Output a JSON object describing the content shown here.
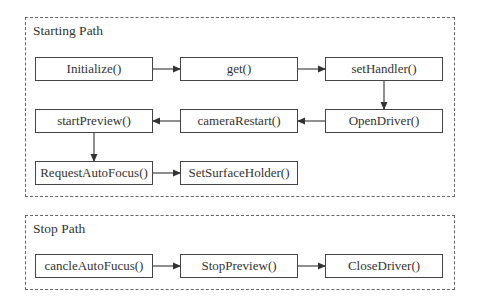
{
  "starting_path": {
    "title": "Starting Path",
    "nodes": [
      {
        "id": "initialize",
        "label": "Initialize()"
      },
      {
        "id": "get",
        "label": "get()"
      },
      {
        "id": "set_handler",
        "label": "setHandler()"
      },
      {
        "id": "open_driver",
        "label": "OpenDriver()"
      },
      {
        "id": "camera_restart",
        "label": "cameraRestart()"
      },
      {
        "id": "start_preview",
        "label": "startPreview()"
      },
      {
        "id": "request_auto_focus",
        "label": "RequestAutoFocus()"
      },
      {
        "id": "set_surface_holder",
        "label": "SetSurfaceHolder()"
      }
    ],
    "edges": [
      [
        "initialize",
        "get"
      ],
      [
        "get",
        "set_handler"
      ],
      [
        "set_handler",
        "open_driver"
      ],
      [
        "open_driver",
        "camera_restart"
      ],
      [
        "camera_restart",
        "start_preview"
      ],
      [
        "start_preview",
        "request_auto_focus"
      ],
      [
        "request_auto_focus",
        "set_surface_holder"
      ]
    ]
  },
  "stop_path": {
    "title": "Stop Path",
    "nodes": [
      {
        "id": "cancle_auto_fucus",
        "label": "cancleAutoFucus()"
      },
      {
        "id": "stop_preview",
        "label": "StopPreview()"
      },
      {
        "id": "close_driver",
        "label": "CloseDriver()"
      }
    ],
    "edges": [
      [
        "cancle_auto_fucus",
        "stop_preview"
      ],
      [
        "stop_preview",
        "close_driver"
      ]
    ]
  },
  "colors": {
    "border": "#444444",
    "dashed": "#666666",
    "text": "#333333",
    "background": "#ffffff"
  }
}
